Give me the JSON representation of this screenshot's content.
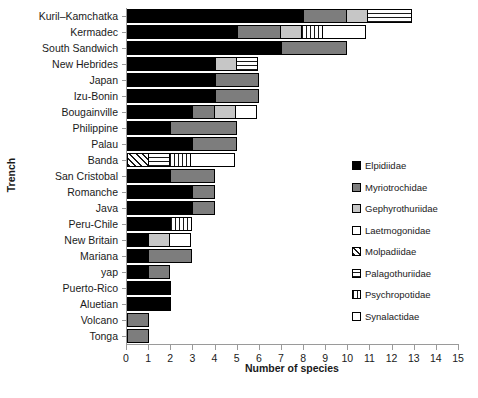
{
  "chart_data": {
    "type": "bar",
    "orientation": "horizontal",
    "stacked": true,
    "title": "",
    "xlabel": "Number of species",
    "ylabel": "Trench",
    "xlim": [
      0,
      15
    ],
    "xticks": [
      0,
      1,
      2,
      3,
      4,
      5,
      6,
      7,
      8,
      9,
      10,
      11,
      12,
      13,
      14,
      15
    ],
    "grid": false,
    "legend_position": "right",
    "categories": [
      "Kuril–Kamchatka",
      "Kermadec",
      "South Sandwich",
      "New Hebrides",
      "Japan",
      "Izu-Bonin",
      "Bougainville",
      "Philippine",
      "Palau",
      "Banda",
      "San Cristobal",
      "Romanche",
      "Java",
      "Peru-Chile",
      "New Britain",
      "Mariana",
      "yap",
      "Puerto-Rico",
      "Aluetian",
      "Volcano",
      "Tonga"
    ],
    "series": [
      {
        "name": "Elpidiidae",
        "fill": "solid-black",
        "color": "#000000",
        "values": [
          8,
          5,
          7,
          4,
          4,
          4,
          3,
          2,
          3,
          0,
          2,
          3,
          3,
          2,
          1,
          1,
          1,
          2,
          2,
          0,
          0
        ]
      },
      {
        "name": "Myriotrochidae",
        "fill": "solid-dark-gray",
        "color": "#7d7d7d",
        "values": [
          2,
          2,
          3,
          0,
          2,
          2,
          1,
          3,
          2,
          0,
          2,
          1,
          1,
          0,
          0,
          2,
          1,
          0,
          0,
          1,
          1
        ]
      },
      {
        "name": "Gephyrothuriidae",
        "fill": "solid-light-gray",
        "color": "#c6c6c6",
        "values": [
          1,
          1,
          0,
          1,
          0,
          0,
          1,
          0,
          0,
          0,
          0,
          0,
          0,
          0,
          1,
          0,
          0,
          0,
          0,
          0,
          0
        ]
      },
      {
        "name": "Laetmogonidae",
        "fill": "white",
        "color": "#ffffff",
        "values": [
          0,
          0,
          0,
          0,
          0,
          0,
          0,
          0,
          0,
          0,
          0,
          0,
          0,
          0,
          0,
          0,
          0,
          0,
          0,
          0,
          0
        ]
      },
      {
        "name": "Molpadiidae",
        "fill": "diagonal-hatch",
        "color": "#d9d9d9",
        "values": [
          0,
          0,
          0,
          0,
          0,
          0,
          0,
          0,
          0,
          1,
          0,
          0,
          0,
          0,
          0,
          0,
          0,
          0,
          0,
          0,
          0
        ]
      },
      {
        "name": "Palagothuriidae",
        "fill": "horizontal-hatch",
        "color": "#e8e8e8",
        "values": [
          2,
          0,
          0,
          1,
          0,
          0,
          0,
          0,
          0,
          1,
          0,
          0,
          0,
          0,
          0,
          0,
          0,
          0,
          0,
          0,
          0
        ]
      },
      {
        "name": "Psychropotidae",
        "fill": "vertical-hatch",
        "color": "#e8e8e8",
        "values": [
          0,
          1,
          0,
          0,
          0,
          0,
          0,
          0,
          0,
          1,
          0,
          0,
          0,
          1,
          0,
          0,
          0,
          0,
          0,
          0,
          0
        ]
      },
      {
        "name": "Synalactidae",
        "fill": "white-outline",
        "color": "#ffffff",
        "values": [
          0,
          2,
          0,
          0,
          0,
          0,
          1,
          0,
          0,
          2,
          0,
          0,
          0,
          0,
          1,
          0,
          0,
          0,
          0,
          0,
          0
        ]
      }
    ],
    "totals": [
      13,
      11,
      10,
      6,
      6,
      6,
      6,
      5,
      5,
      5,
      4,
      4,
      4,
      3,
      3,
      3,
      2,
      2,
      2,
      1,
      1
    ]
  }
}
